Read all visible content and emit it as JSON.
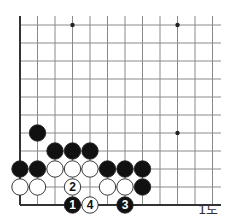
{
  "diagram": {
    "caption": "1도",
    "grid": {
      "origin_x": 20,
      "origin_y": 25,
      "dx": 17.5,
      "dy": 18,
      "cols": 12,
      "rows": 10,
      "right_edge_x": 221,
      "top_edge_y": 16
    },
    "star_points": [
      [
        3,
        0
      ],
      [
        9,
        0
      ],
      [
        9,
        6
      ]
    ],
    "stones": [
      {
        "col": 1,
        "row": 6,
        "color": "black",
        "label": ""
      },
      {
        "col": 2,
        "row": 7,
        "color": "black",
        "label": ""
      },
      {
        "col": 3,
        "row": 7,
        "color": "black",
        "label": ""
      },
      {
        "col": 4,
        "row": 7,
        "color": "black",
        "label": ""
      },
      {
        "col": 0,
        "row": 8,
        "color": "black",
        "label": ""
      },
      {
        "col": 1,
        "row": 8,
        "color": "black",
        "label": ""
      },
      {
        "col": 2,
        "row": 8,
        "color": "white",
        "label": ""
      },
      {
        "col": 3,
        "row": 8,
        "color": "white",
        "label": ""
      },
      {
        "col": 4,
        "row": 8,
        "color": "white",
        "label": ""
      },
      {
        "col": 5,
        "row": 8,
        "color": "black",
        "label": ""
      },
      {
        "col": 6,
        "row": 8,
        "color": "black",
        "label": ""
      },
      {
        "col": 7,
        "row": 8,
        "color": "black",
        "label": ""
      },
      {
        "col": 0,
        "row": 9,
        "color": "white",
        "label": ""
      },
      {
        "col": 1,
        "row": 9,
        "color": "white",
        "label": ""
      },
      {
        "col": 3,
        "row": 9,
        "color": "white",
        "label": "2"
      },
      {
        "col": 5,
        "row": 9,
        "color": "white",
        "label": ""
      },
      {
        "col": 6,
        "row": 9,
        "color": "white",
        "label": ""
      },
      {
        "col": 7,
        "row": 9,
        "color": "black",
        "label": ""
      },
      {
        "col": 3,
        "row": 10,
        "color": "black",
        "label": "1"
      },
      {
        "col": 4,
        "row": 10,
        "color": "white",
        "label": "4"
      },
      {
        "col": 6,
        "row": 10,
        "color": "black",
        "label": "3"
      }
    ],
    "colors": {
      "grid": "#8a8a8a",
      "edge": "#333333",
      "black_stone": "#111111",
      "white_stone": "#ffffff",
      "stone_outline": "#222222"
    }
  }
}
